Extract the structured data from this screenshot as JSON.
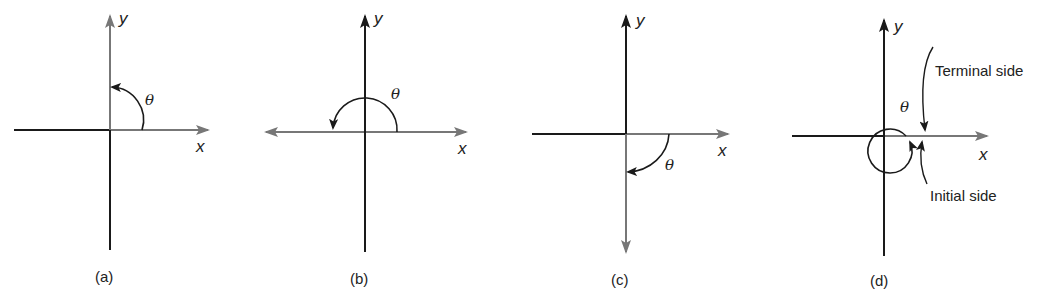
{
  "figure": {
    "panels": [
      {
        "id": "a",
        "caption": "(a)",
        "x_label": "x",
        "y_label": "y",
        "angle_label": "θ",
        "description": "Counterclockwise 90° angle from positive x-axis to positive y-axis"
      },
      {
        "id": "b",
        "caption": "(b)",
        "x_label": "x",
        "y_label": "y",
        "angle_label": "θ",
        "description": "Counterclockwise 180° angle from positive x-axis to negative x-axis"
      },
      {
        "id": "c",
        "caption": "(c)",
        "x_label": "x",
        "y_label": "y",
        "angle_label": "θ",
        "description": "Clockwise -90° angle from positive x-axis to negative y-axis"
      },
      {
        "id": "d",
        "caption": "(d)",
        "x_label": "x",
        "y_label": "y",
        "angle_label": "θ",
        "terminal_side_label": "Terminal side",
        "initial_side_label": "Initial side",
        "description": "Full 360° counterclockwise rotation; terminal side coincides with initial side"
      }
    ],
    "colors": {
      "axis_dark": "#1a1a1a",
      "axis_gray": "#777777",
      "arc": "#1a1a1a"
    }
  }
}
